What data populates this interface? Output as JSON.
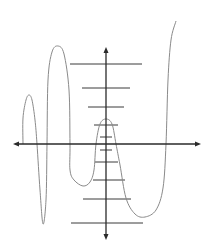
{
  "diagram": {
    "title": "",
    "type": "horizontal-line-test",
    "colors": {
      "background": "#ffffff",
      "axes": "#2a2a2a",
      "curve": "#8a8a8a",
      "horizontal_lines": "#3a3a3a"
    },
    "axes": {
      "x_axis": {
        "y": 144,
        "x_start": 13,
        "x_end": 201
      },
      "y_axis": {
        "x": 106,
        "y_start": 47,
        "y_end": 240
      }
    },
    "curve_points": [
      [
        23,
        144
      ],
      [
        23,
        118
      ],
      [
        26,
        100
      ],
      [
        29,
        95
      ],
      [
        32,
        100
      ],
      [
        35,
        120
      ],
      [
        37,
        144
      ],
      [
        40,
        190
      ],
      [
        43,
        224
      ],
      [
        46,
        200
      ],
      [
        47,
        144
      ],
      [
        48,
        80
      ],
      [
        52,
        52
      ],
      [
        58,
        46
      ],
      [
        64,
        54
      ],
      [
        69,
        90
      ],
      [
        70,
        144
      ],
      [
        70,
        170
      ],
      [
        74,
        180
      ],
      [
        83,
        186
      ],
      [
        90,
        182
      ],
      [
        94,
        170
      ],
      [
        96,
        144
      ],
      [
        100,
        124
      ],
      [
        106,
        119
      ],
      [
        112,
        124
      ],
      [
        116,
        144
      ],
      [
        120,
        165
      ],
      [
        126,
        198
      ],
      [
        135,
        214
      ],
      [
        145,
        217
      ],
      [
        156,
        210
      ],
      [
        163,
        188
      ],
      [
        166,
        144
      ],
      [
        168,
        80
      ],
      [
        171,
        40
      ],
      [
        176,
        21
      ]
    ],
    "horizontal_lines": [
      {
        "y": 64,
        "x1": 70,
        "x2": 142
      },
      {
        "y": 88,
        "x1": 82,
        "x2": 130
      },
      {
        "y": 107,
        "x1": 88,
        "x2": 124
      },
      {
        "y": 125,
        "x1": 94,
        "x2": 118
      },
      {
        "y": 137,
        "x1": 100,
        "x2": 112
      },
      {
        "y": 150,
        "x1": 100,
        "x2": 112
      },
      {
        "y": 162,
        "x1": 95,
        "x2": 118
      },
      {
        "y": 180,
        "x1": 93,
        "x2": 125
      },
      {
        "y": 199,
        "x1": 83,
        "x2": 131
      },
      {
        "y": 223,
        "x1": 71,
        "x2": 143
      }
    ]
  }
}
